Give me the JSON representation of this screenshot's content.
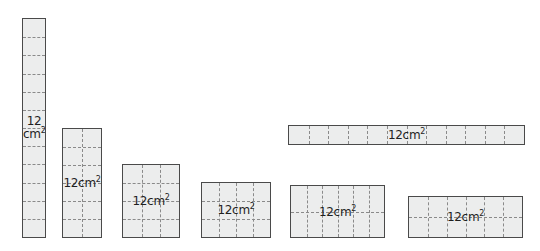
{
  "figure": {
    "title": "",
    "unit_label": "cm",
    "unit_exponent": "2",
    "area_value": "12",
    "background_color": "#ffffff",
    "rect_fill_color": "#eceded",
    "rect_border_color": "#4a4a4a",
    "grid_line_color": "#8a8a8a",
    "text_color": "#1f1f1f"
  },
  "rectangles": [
    {
      "id": "rect-1x12",
      "label_number": "12",
      "label_unit": "cm",
      "label_exponent": "2",
      "label_style": "stacked",
      "columns": 1,
      "rows": 12,
      "x": 22,
      "y": 18,
      "width": 24,
      "height": 220
    },
    {
      "id": "rect-2x6",
      "label_number": "12",
      "label_unit": "cm",
      "label_exponent": "2",
      "label_style": "inline",
      "columns": 2,
      "rows": 6,
      "x": 62,
      "y": 128,
      "width": 40,
      "height": 110
    },
    {
      "id": "rect-3x4",
      "label_number": "12",
      "label_unit": "cm",
      "label_exponent": "2",
      "label_style": "inline",
      "columns": 3,
      "rows": 4,
      "x": 122,
      "y": 164,
      "width": 58,
      "height": 74
    },
    {
      "id": "rect-4x3",
      "label_number": "12",
      "label_unit": "cm",
      "label_exponent": "2",
      "label_style": "inline",
      "columns": 4,
      "rows": 3,
      "x": 201,
      "y": 182,
      "width": 70,
      "height": 56
    },
    {
      "id": "rect-12x1",
      "label_number": "12",
      "label_unit": "cm",
      "label_exponent": "2",
      "label_style": "inline",
      "columns": 12,
      "rows": 1,
      "x": 288,
      "y": 125,
      "width": 237,
      "height": 20
    },
    {
      "id": "rect-6x2-a",
      "label_number": "12",
      "label_unit": "cm",
      "label_exponent": "2",
      "label_style": "inline",
      "columns": 6,
      "rows": 2,
      "x": 290,
      "y": 185,
      "width": 95,
      "height": 53
    },
    {
      "id": "rect-6x2-b",
      "label_number": "12",
      "label_unit": "cm",
      "label_exponent": "2",
      "label_style": "inline",
      "columns": 6,
      "rows": 2,
      "x": 408,
      "y": 196,
      "width": 115,
      "height": 42
    }
  ]
}
